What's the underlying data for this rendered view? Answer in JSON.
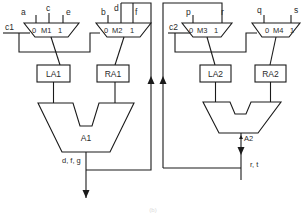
{
  "diagram": {
    "muxes": [
      {
        "id": "M1",
        "label": "M1",
        "sel0": "0",
        "sel1": "1"
      },
      {
        "id": "M2",
        "label": "M2",
        "sel0": "0",
        "sel1": "1"
      },
      {
        "id": "M3",
        "label": "M3",
        "sel0": "0",
        "sel1": "1"
      },
      {
        "id": "M4",
        "label": "M4",
        "sel0": "0",
        "sel1": "1"
      }
    ],
    "inputs": {
      "a": "a",
      "c": "c",
      "e": "e",
      "b": "b",
      "d": "d",
      "f": "f",
      "p": "p",
      "r": "r",
      "q": "q",
      "s": "s"
    },
    "selects": {
      "c1": "c1",
      "c2": "c2"
    },
    "registers": [
      {
        "id": "LA1",
        "label": "LA1"
      },
      {
        "id": "RA1",
        "label": "RA1"
      },
      {
        "id": "LA2",
        "label": "LA2"
      },
      {
        "id": "RA2",
        "label": "RA2"
      }
    ],
    "alus": [
      {
        "id": "A1",
        "label": "A1",
        "output": "d, f, g"
      },
      {
        "id": "A2",
        "label": "A2",
        "output": "r, t"
      }
    ],
    "caption": "(b)"
  }
}
